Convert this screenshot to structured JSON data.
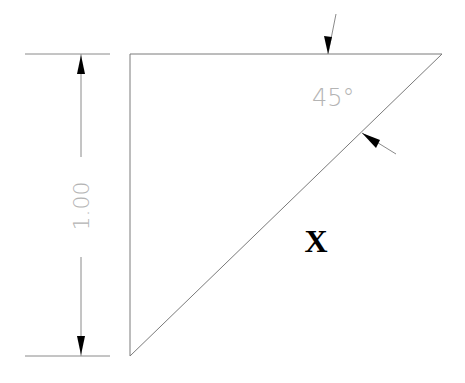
{
  "diagram": {
    "type": "technical-drawing",
    "colors": {
      "lines": "#7a7a7a",
      "arrowheads": "#000000",
      "dimension_text": "#b4b4b4",
      "label": "#000000",
      "background": "#ffffff"
    },
    "triangle": {
      "vertices": [
        {
          "x": 130,
          "y": 54
        },
        {
          "x": 442,
          "y": 54
        },
        {
          "x": 130,
          "y": 356
        }
      ]
    },
    "vertical_dimension": {
      "value_text": "1.00",
      "extension_lines": [
        {
          "x1": 25,
          "x2": 110,
          "y": 54
        },
        {
          "x1": 25,
          "x2": 110,
          "y": 356
        }
      ],
      "dimension_line_x": 81
    },
    "angle_dimension": {
      "value_text": "45°",
      "arrows": [
        {
          "from": {
            "x": 336,
            "y": 14
          },
          "to": {
            "x": 328,
            "y": 54
          }
        },
        {
          "from": {
            "x": 396,
            "y": 154
          },
          "to": {
            "x": 362,
            "y": 133
          }
        }
      ]
    },
    "label": {
      "text": "X"
    }
  }
}
